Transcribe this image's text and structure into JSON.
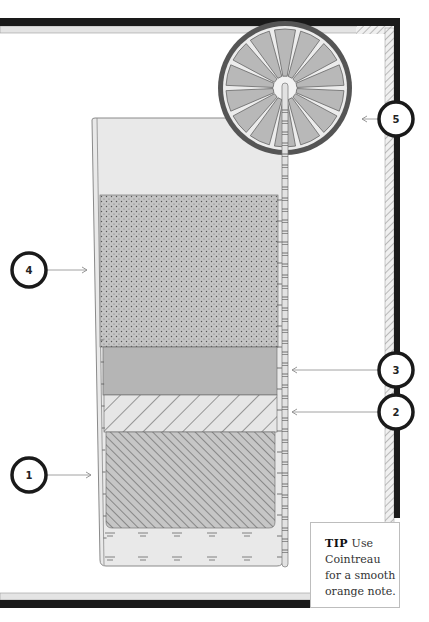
{
  "diagram": {
    "title": "",
    "colors": {
      "frame_dark": "#1a1a1a",
      "frame_light": "#e6e6e6",
      "glass_fill": "#e9e9e9",
      "glass_edge": "#8a8a8a",
      "layer_dotted": "#bdbdbd",
      "layer_solid": "#b5b5b5",
      "layer_light_hatch": "#e4e4e4",
      "layer_dark_hatch": "#c2c2c2",
      "orange_rind": "#555555",
      "orange_segment": "#b8b8b8",
      "callout_ring": "#1a1a1a",
      "arrow": "#8c8c8c"
    },
    "callouts": [
      {
        "number": "1",
        "target": "bottom dark hatched layer"
      },
      {
        "number": "2",
        "target": "light hatched layer"
      },
      {
        "number": "3",
        "target": "solid gray layer"
      },
      {
        "number": "4",
        "target": "dotted top layer"
      },
      {
        "number": "5",
        "target": "orange wheel garnish"
      }
    ],
    "layers": [
      {
        "id": "layer-1",
        "pattern": "dark-diagonal-hatch"
      },
      {
        "id": "layer-2",
        "pattern": "light-diagonal-hatch"
      },
      {
        "id": "layer-3",
        "pattern": "solid"
      },
      {
        "id": "layer-4",
        "pattern": "dotted"
      }
    ],
    "orange_wheel_segments": 14
  },
  "tip": {
    "label": "TIP",
    "text": "Use Cointreau for a smooth orange note."
  }
}
